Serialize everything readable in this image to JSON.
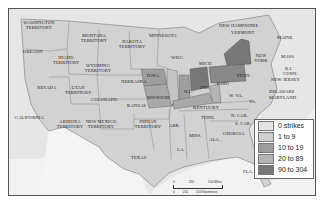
{
  "map": {
    "title": "",
    "legend": {
      "items": [
        {
          "label": "0 strikes",
          "color": "#e4e4e4"
        },
        {
          "label": "1 to 9",
          "color": "#cfcfcf"
        },
        {
          "label": "10 to 19",
          "color": "#9e9e9e"
        },
        {
          "label": "20 to 89",
          "color": "#b4b4b4"
        },
        {
          "label": "90 to 304",
          "color": "#777777"
        }
      ]
    },
    "scale": {
      "miles": [
        "0",
        "250",
        "500 Miles"
      ],
      "km": [
        "0",
        "250",
        "500 Kilometers"
      ]
    },
    "regions": {
      "washington": "Washington Territory",
      "oregon": "Oregon",
      "idaho": "Idaho Territory",
      "montana": "Montana Territory",
      "wyoming": "Wyoming Territory",
      "dakota": "Dakota Territory",
      "minnesota": "Minnesota",
      "nevada": "Nevada",
      "utah": "Utah Territory",
      "colorado": "Colorado",
      "nebraska": "Nebraska",
      "kansas": "Kansas",
      "california": "California",
      "arizona": "Arizona Territory",
      "new_mexico": "New Mexico Territory",
      "indian": "Indian Territory",
      "texas": "Texas",
      "iowa": "Iowa",
      "missouri": "Missouri",
      "wisc": "Wisc.",
      "mich": "Mich.",
      "ill": "Ill.",
      "ind": "Ind.",
      "ohio": "Ohio",
      "kentucky": "Kentucky",
      "ark": "Ark.",
      "la": "La.",
      "miss": "Miss.",
      "ala": "Ala.",
      "tenn": "Tenn.",
      "georgia": "Georgia",
      "fla": "Fla.",
      "s_car": "S. Car.",
      "n_car": "N. Car.",
      "va": "Va.",
      "w_va": "W. Va.",
      "penn": "Penn.",
      "new_york": "New York",
      "new_hampshire": "New Hampshire",
      "vermont": "Vermont",
      "maine": "Maine",
      "mass": "Mass.",
      "ri": "R.I.",
      "conn": "Conn.",
      "new_jersey": "New Jersey",
      "delaware": "Delaware",
      "maryland": "Maryland"
    }
  }
}
